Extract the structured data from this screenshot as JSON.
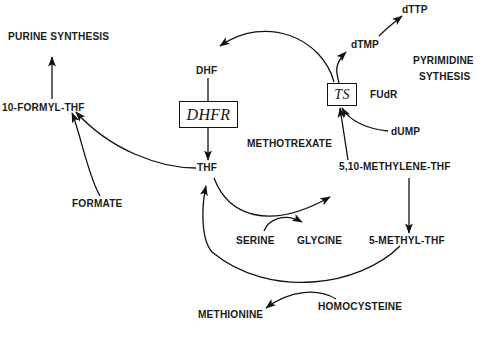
{
  "diagram": {
    "type": "biochemical-pathway",
    "background_color": "#ffffff",
    "line_color": "#111111",
    "text_color": "#1b1b1b"
  },
  "labels": {
    "purine_synthesis": "PURINE SYNTHESIS",
    "formyl_thf": "10-FORMYL-THF",
    "formate": "FORMATE",
    "dhf": "DHF",
    "thf": "THF",
    "methotrexate": "METHOTREXATE",
    "dttp": "dTTP",
    "dtmp": "dTMP",
    "pyrimidine": "PYRIMIDINE",
    "sythesis": "SYTHESIS",
    "fudr": "FUdR",
    "dump": "dUMP",
    "methylene_thf": "5,10-METHYLENE-THF",
    "methyl_thf": "5-METHYL-THF",
    "serine": "SERINE",
    "glycine": "GLYCINE",
    "methionine": "METHIONINE",
    "homocysteine": "HOMOCYSTEINE"
  },
  "enzymes": {
    "dhfr": "DHFR",
    "ts": "TS"
  },
  "edges": [
    {
      "name": "dhf-to-thf",
      "from": "DHF",
      "to": "THF",
      "via": "DHFR",
      "style": "straight"
    },
    {
      "name": "formylthf-to-purine",
      "from": "10-FORMYL-THF",
      "to": "PURINE SYNTHESIS",
      "style": "straight"
    },
    {
      "name": "thf-to-formylthf",
      "from": "THF",
      "to": "10-FORMYL-THF",
      "style": "curved"
    },
    {
      "name": "formate-to-formylthf",
      "from": "FORMATE",
      "to": "10-FORMYL-THF",
      "style": "curved"
    },
    {
      "name": "ts-to-dhf",
      "from": "TS",
      "to": "DHF",
      "style": "arc"
    },
    {
      "name": "dtmp-to-dttp",
      "from": "dTMP",
      "to": "dTTP",
      "style": "curved"
    },
    {
      "name": "ts-to-dtmp",
      "from": "TS",
      "to": "dTMP",
      "style": "curved"
    },
    {
      "name": "dump-to-ts",
      "from": "dUMP",
      "to": "TS",
      "style": "curved"
    },
    {
      "name": "methylenethf-to-ts",
      "from": "5,10-METHYLENE-THF",
      "to": "TS",
      "style": "straight"
    },
    {
      "name": "methylenethf-to-methylthf",
      "from": "5,10-METHYLENE-THF",
      "to": "5-METHYL-THF",
      "style": "straight"
    },
    {
      "name": "thf-to-methylenethf",
      "from": "THF",
      "to": "5,10-METHYLENE-THF",
      "style": "curved"
    },
    {
      "name": "serine-to-glycine",
      "from": "SERINE",
      "to": "GLYCINE",
      "style": "curved"
    },
    {
      "name": "methylthf-to-thf",
      "from": "5-METHYL-THF",
      "to": "THF",
      "style": "curved"
    },
    {
      "name": "homocysteine-to-methionine",
      "from": "HOMOCYSTEINE",
      "to": "METHIONINE",
      "style": "curved"
    }
  ]
}
